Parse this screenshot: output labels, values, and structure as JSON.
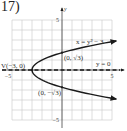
{
  "problem_label": "17)",
  "chart_data": {
    "type": "line",
    "title": "",
    "xlabel": "",
    "ylabel": "y",
    "xlim": [
      -5,
      5
    ],
    "ylim": [
      -5,
      5
    ],
    "grid": true,
    "grid_step": 1,
    "x_tick_labels": [
      {
        "value": -5,
        "label": "-5"
      },
      {
        "value": 5,
        "label": "5"
      }
    ],
    "y_tick_labels": [
      {
        "value": 5,
        "label": "5"
      },
      {
        "value": -5,
        "label": "-5"
      }
    ],
    "series": [
      {
        "name": "x = y² − 3",
        "equation": "x = y^2 - 3",
        "style": "solid",
        "param": "y",
        "y_range": [
          -2.9,
          2.9
        ],
        "arrows": "both-ends"
      },
      {
        "name": "y = 0",
        "equation": "y = 0",
        "style": "dashed",
        "axis_of_symmetry": true
      }
    ],
    "points": [
      {
        "name": "vertex",
        "x": -3,
        "y": 0,
        "label": "V(−3, 0)"
      },
      {
        "name": "y-intercept-upper",
        "x": 0,
        "y": 1.732,
        "label": "(0, √3)"
      },
      {
        "name": "y-intercept-lower",
        "x": 0,
        "y": -1.732,
        "label": "(0, −√3)"
      }
    ],
    "annotations": [
      {
        "text": "x = y² − 3",
        "near": "upper-right branch"
      },
      {
        "text": "y = 0",
        "near": "right of x-axis"
      }
    ]
  }
}
